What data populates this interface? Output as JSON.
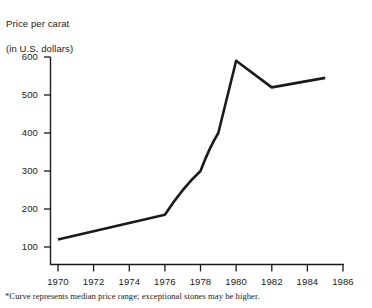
{
  "header": {
    "title_line1": "Price per carat",
    "title_line2": "(in U.S. dollars)"
  },
  "footnote": "*Curve represents median price range; exceptional stones may be higher.",
  "style": {
    "line_color": "#1a1a1a",
    "axis_color": "#1a1a1a",
    "background": "#ffffff"
  },
  "chart_data": {
    "type": "line",
    "title": "Price per carat (in U.S. dollars)",
    "xlabel": "",
    "ylabel": "Price per carat (in U.S. dollars)",
    "xlim": [
      1970,
      1986
    ],
    "ylim": [
      0,
      600
    ],
    "grid": false,
    "legend": false,
    "x_ticks": [
      "1970",
      "1972",
      "1974",
      "1976",
      "1978",
      "1980",
      "1982",
      "1984",
      "1986"
    ],
    "x_tick_values": [
      1970,
      1972,
      1974,
      1976,
      1978,
      1980,
      1982,
      1984,
      1986
    ],
    "y_ticks": [
      "100",
      "200",
      "300",
      "400",
      "500",
      "600"
    ],
    "y_tick_values": [
      100,
      200,
      300,
      400,
      500,
      600
    ],
    "x": [
      1970,
      1976,
      1978,
      1979,
      1980,
      1982,
      1985
    ],
    "values": [
      120,
      185,
      300,
      400,
      590,
      520,
      545
    ],
    "annotation": "*Curve represents median price range; exceptional stones may be higher."
  }
}
